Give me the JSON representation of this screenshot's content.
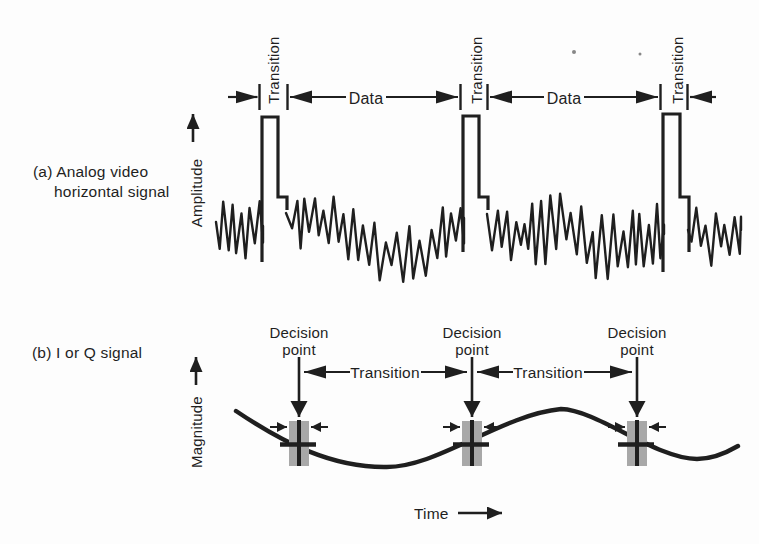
{
  "colors": {
    "ink": "#1f1f1f",
    "marker_gray": "#a8a8a8",
    "background": "#fdfdfd"
  },
  "panel_a": {
    "caption_line1": "(a) Analog video",
    "caption_line2": "horizontal signal",
    "axis_label": "Amplitude",
    "data_labels": [
      "Data",
      "Data"
    ],
    "pulses": [
      {
        "transition_label": "Transition",
        "path": "M262,262 L262,117 L278,117 L278,197 L287,197 L287,210"
      },
      {
        "transition_label": "Transition",
        "path": "M463,252 L463,116 L479,116 L479,197 L488,197 L488,210"
      },
      {
        "transition_label": "Transition",
        "path": "M663,272 L663,114 L680,114 L680,197 L689,197 L689,252"
      }
    ],
    "noise": {
      "seed": 9,
      "clamp": [
        186,
        294
      ],
      "segments": [
        {
          "x0": 216,
          "x1": 263,
          "amp": 28,
          "centers": [
            [
              216,
              222
            ],
            [
              238,
              234
            ],
            [
              263,
              226
            ]
          ]
        },
        {
          "x0": 286,
          "x1": 464,
          "amp": 33,
          "centers": [
            [
              286,
              213
            ],
            [
              320,
              226
            ],
            [
              352,
              232
            ],
            [
              396,
              257
            ],
            [
              428,
              250
            ],
            [
              464,
              218
            ]
          ]
        },
        {
          "x0": 487,
          "x1": 664,
          "amp": 35,
          "centers": [
            [
              487,
              214
            ],
            [
              525,
              236
            ],
            [
              562,
              226
            ],
            [
              602,
              248
            ],
            [
              638,
              242
            ],
            [
              664,
              234
            ]
          ]
        },
        {
          "x0": 688,
          "x1": 741,
          "amp": 27,
          "centers": [
            [
              688,
              230
            ],
            [
              712,
              240
            ],
            [
              741,
              230
            ]
          ]
        }
      ]
    }
  },
  "panel_b": {
    "caption": "(b) I or Q signal",
    "axis_label": "Magnitude",
    "signal_path": "M236,411 C285,444 332,467 384,467 C436,469 500,415 561,409 C598,410 656,459 697,459 C712,459 726,453 738,446",
    "decision_points": [
      {
        "x": 299,
        "label_line1": "Decision",
        "label_line2": "point"
      },
      {
        "x": 472,
        "label_line1": "Decision",
        "label_line2": "point"
      },
      {
        "x": 637,
        "label_line1": "Decision",
        "label_line2": "point"
      }
    ],
    "transition_labels": [
      "Transition",
      "Transition"
    ]
  },
  "time_axis": {
    "label": "Time"
  }
}
